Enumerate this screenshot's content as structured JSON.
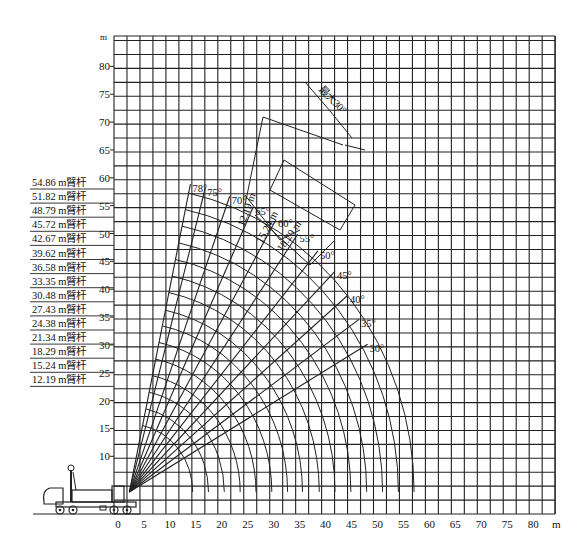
{
  "chart_data": {
    "type": "line",
    "title": "",
    "xlabel": "m",
    "ylabel": "m",
    "xlim": [
      0,
      85
    ],
    "ylim": [
      0,
      85
    ],
    "grid": true,
    "x_ticks": [
      0,
      5,
      10,
      15,
      20,
      25,
      30,
      35,
      40,
      45,
      50,
      55,
      60,
      65,
      70,
      75,
      80
    ],
    "y_ticks": [
      10,
      15,
      20,
      25,
      30,
      35,
      40,
      45,
      50,
      55,
      60,
      65,
      70,
      75,
      80
    ],
    "boom_lengths_m": [
      12.19,
      15.24,
      18.29,
      21.34,
      24.38,
      27.43,
      30.48,
      33.35,
      36.58,
      39.62,
      42.67,
      45.72,
      48.79,
      51.82,
      54.86
    ],
    "boom_labels": [
      "54.86 m臂杆",
      "51.82 m臂杆",
      "48.79 m臂杆",
      "45.72 m臂杆",
      "42.67 m臂杆",
      "39.62 m臂杆",
      "36.58 m臂杆",
      "33.35 m臂杆",
      "30.48 m臂杆",
      "27.43 m臂杆",
      "24.38 m臂杆",
      "21.34 m臂杆",
      "18.29 m臂杆",
      "15.24 m臂杆",
      "12.19 m臂杆"
    ],
    "boom_angles_deg": [
      78,
      75,
      70,
      65,
      60,
      55,
      50,
      45,
      40,
      35,
      30
    ],
    "angle_labels": [
      "78°",
      "75°",
      "70°",
      "65°",
      "60°",
      "55°",
      "50°",
      "45°",
      "40°",
      "35°",
      "30°"
    ],
    "jib_annotations": {
      "max_offset_label": "最大30°",
      "jib_lengths": [
        "12.19 m",
        "15.24 m",
        "18.29 m"
      ]
    },
    "series": [
      {
        "name": "boom radius arcs",
        "description": "Working range arcs centered at boom pivot for each boom length"
      },
      {
        "name": "boom angle lines",
        "description": "Radial lines from pivot at each boom angle"
      }
    ]
  }
}
